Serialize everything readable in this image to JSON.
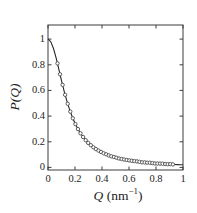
{
  "figure": {
    "background": "#ffffff",
    "axis_color": "#3d3d3d",
    "line_color": "#262626",
    "marker_stroke_color": "#4d4d4d",
    "marker_fill_color": "#ffffff"
  },
  "chart_data": {
    "type": "line",
    "title": "",
    "xlabel": "Q (nm⁻¹)",
    "xlabel_parts": {
      "symbol": "Q",
      "unit_prefix": " (nm",
      "exponent": "−1",
      "suffix": ")"
    },
    "ylabel": "P(Q)",
    "xlim": [
      0,
      1
    ],
    "ylim": [
      -0.02,
      1.11
    ],
    "grid": false,
    "legend": null,
    "x_ticks": [
      0,
      0.2,
      0.4,
      0.6,
      0.8,
      1
    ],
    "x_tick_labels": [
      "0",
      "0.2",
      "0.4",
      "0.6",
      "0.8",
      "1"
    ],
    "y_ticks": [
      0,
      0.2,
      0.4,
      0.6,
      0.8,
      1
    ],
    "y_tick_labels": [
      "0",
      "0.2",
      "0.4",
      "0.6",
      "0.8",
      "1"
    ],
    "series": [
      {
        "name": "fit-line",
        "type": "line",
        "x": [
          0,
          0.02,
          0.04,
          0.06,
          0.08,
          0.1,
          0.12,
          0.14,
          0.16,
          0.18,
          0.2,
          0.22,
          0.24,
          0.26,
          0.28,
          0.3,
          0.32,
          0.34,
          0.36,
          0.38,
          0.4,
          0.42,
          0.44,
          0.46,
          0.48,
          0.5,
          0.52,
          0.54,
          0.56,
          0.58,
          0.6,
          0.62,
          0.64,
          0.66,
          0.68,
          0.7,
          0.72,
          0.74,
          0.76,
          0.78,
          0.8,
          0.82,
          0.84,
          0.86,
          0.88,
          0.9,
          0.92,
          0.94,
          0.96,
          0.98,
          1
        ],
        "y": [
          1,
          0.981,
          0.929,
          0.854,
          0.766,
          0.677,
          0.593,
          0.517,
          0.451,
          0.393,
          0.344,
          0.303,
          0.267,
          0.237,
          0.211,
          0.189,
          0.17,
          0.154,
          0.139,
          0.127,
          0.116,
          0.106,
          0.098,
          0.09,
          0.084,
          0.078,
          0.072,
          0.067,
          0.063,
          0.059,
          0.055,
          0.052,
          0.049,
          0.046,
          0.043,
          0.041,
          0.039,
          0.037,
          0.035,
          0.033,
          0.032,
          0.03,
          0.029,
          0.028,
          0.026,
          0.025,
          0.024,
          0.023,
          0.022,
          0.021,
          0.021
        ]
      },
      {
        "name": "data-points",
        "type": "scatter",
        "x": [
          0.07,
          0.089,
          0.108,
          0.127,
          0.146,
          0.165,
          0.184,
          0.203,
          0.222,
          0.241,
          0.26,
          0.279,
          0.298,
          0.317,
          0.336,
          0.355,
          0.374,
          0.393,
          0.412,
          0.431,
          0.45,
          0.469,
          0.488,
          0.507,
          0.526,
          0.545,
          0.564,
          0.583,
          0.602,
          0.621,
          0.64,
          0.659,
          0.678,
          0.697,
          0.716,
          0.735,
          0.754,
          0.773,
          0.792,
          0.811,
          0.83,
          0.849,
          0.868,
          0.887,
          0.906,
          0.925
        ],
        "y": [
          0.811,
          0.726,
          0.643,
          0.566,
          0.496,
          0.435,
          0.383,
          0.338,
          0.299,
          0.266,
          0.237,
          0.212,
          0.191,
          0.173,
          0.157,
          0.143,
          0.131,
          0.12,
          0.11,
          0.102,
          0.094,
          0.087,
          0.081,
          0.076,
          0.07,
          0.066,
          0.062,
          0.058,
          0.055,
          0.052,
          0.049,
          0.047,
          0.044,
          0.04,
          0.039,
          0.037,
          0.037,
          0.034,
          0.031,
          0.031,
          0.03,
          0.029,
          0.027,
          0.025,
          0.026,
          0.024
        ]
      }
    ]
  }
}
